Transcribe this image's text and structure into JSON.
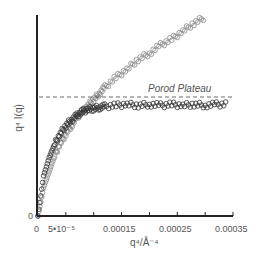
{
  "chart_data": {
    "type": "scatter",
    "title": "",
    "xlabel": "q⁴/Å⁻⁴",
    "ylabel": "q⁴ I(q)",
    "xlim": [
      0,
      0.00035
    ],
    "ylim": [
      0,
      1.0
    ],
    "grid": false,
    "x_tick_labels": [
      "0",
      "5•10⁻⁵",
      "0.00015",
      "0.00025",
      "0.00035"
    ],
    "x_ticks": [
      0,
      5e-05,
      0.0001,
      0.00015,
      0.0002,
      0.00025,
      0.0003,
      0.00035
    ],
    "y_tick_labels": [
      "0"
    ],
    "annotations": [
      {
        "text": "Porod Plateau",
        "type": "horizontal-dashed-line",
        "y": 0.59
      }
    ],
    "series": [
      {
        "name": "plateau-series",
        "color": "#333333",
        "marker": "open-circle",
        "x": [
          0,
          1e-05,
          2e-05,
          3e-05,
          4e-05,
          5e-05,
          6e-05,
          7e-05,
          8e-05,
          9e-05,
          0.0001,
          0.00011,
          0.00012,
          0.00014,
          0.00016,
          0.00018,
          0.0002,
          0.00022,
          0.00024,
          0.00026,
          0.00028,
          0.0003,
          0.00032,
          0.00034
        ],
        "y": [
          0,
          0.2,
          0.29,
          0.36,
          0.41,
          0.45,
          0.48,
          0.5,
          0.52,
          0.53,
          0.535,
          0.54,
          0.545,
          0.55,
          0.555,
          0.55,
          0.555,
          0.55,
          0.555,
          0.55,
          0.555,
          0.55,
          0.555,
          0.555
        ]
      },
      {
        "name": "rising-series",
        "color": "#888888",
        "marker": "open-circle",
        "x": [
          0,
          1e-05,
          2e-05,
          3e-05,
          4e-05,
          5e-05,
          6e-05,
          7e-05,
          8e-05,
          9e-05,
          0.0001,
          0.00011,
          0.00012,
          0.00014,
          0.00016,
          0.00018,
          0.0002,
          0.00022,
          0.00024,
          0.00026,
          0.00028,
          0.0003
        ],
        "y": [
          0,
          0.14,
          0.22,
          0.3,
          0.36,
          0.41,
          0.45,
          0.49,
          0.52,
          0.55,
          0.58,
          0.61,
          0.64,
          0.69,
          0.73,
          0.78,
          0.81,
          0.85,
          0.88,
          0.92,
          0.96,
          0.99
        ]
      }
    ]
  }
}
